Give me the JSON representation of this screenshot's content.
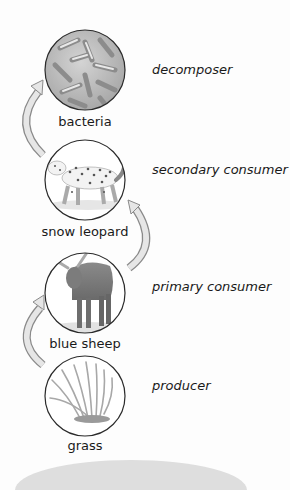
{
  "diagram": {
    "type": "food chain",
    "levels": [
      {
        "organism": "bacteria",
        "role": "decomposer",
        "icon": "bacteria-icon"
      },
      {
        "organism": "snow leopard",
        "role": "secondary consumer",
        "icon": "snow-leopard-icon"
      },
      {
        "organism": "blue sheep",
        "role": "primary consumer",
        "icon": "blue-sheep-icon"
      },
      {
        "organism": "grass",
        "role": "producer",
        "icon": "grass-icon"
      }
    ],
    "arrows": [
      {
        "from": "grass",
        "to": "blue sheep"
      },
      {
        "from": "blue sheep",
        "to": "snow leopard"
      },
      {
        "from": "snow leopard",
        "to": "bacteria"
      }
    ],
    "colors": {
      "circle_stroke": "#2a2a2a",
      "arrow_fill": "#e6e6e6",
      "arrow_stroke": "#8a8a8a",
      "base_band": "#dedede"
    }
  }
}
